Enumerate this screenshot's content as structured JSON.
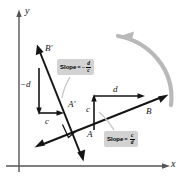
{
  "figure": {
    "background": "#ffffff",
    "ink_color": "#151515",
    "rotation_arrow_color": "#b5b5b5",
    "label_box_color": "#d2d2d2",
    "leader_line_color": "#c9c9c9"
  },
  "axes": {
    "x_label": "x",
    "y_label": "y",
    "color": "#4a4a4a"
  },
  "points": {
    "A": "A",
    "B": "B",
    "A_prime": "A'",
    "B_prime": "B'"
  },
  "segments": {
    "run_right": "d",
    "rise_right": "c",
    "run_left": "c",
    "rise_left": "−d"
  },
  "slope_labels": [
    {
      "name": "slope-line-ab-prime",
      "prefix": "Slope",
      "equals": "=",
      "sign": "−",
      "numerator": "d",
      "denominator": "c",
      "text": "Slope = −d/c"
    },
    {
      "name": "slope-line-ab",
      "prefix": "Slope",
      "equals": "=",
      "sign": "",
      "numerator": "c",
      "denominator": "d",
      "text": "Slope = c/d"
    }
  ],
  "annotations": {
    "right_angle_marker": "right-angle",
    "rotation": "90° counterclockwise rotation"
  }
}
